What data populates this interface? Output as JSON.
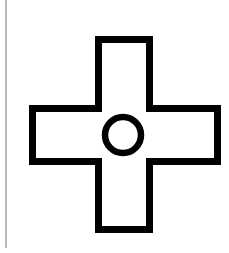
{
  "figure": {
    "symbol": "cross-with-circle",
    "icon_name": "plus-cross-circle-icon",
    "stroke_color": "#000000",
    "fill_color": "#ffffff",
    "background_color": "#ffffff",
    "edge_line_color": "#b8b8b8"
  }
}
